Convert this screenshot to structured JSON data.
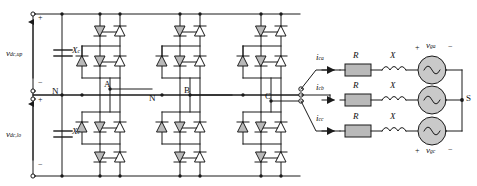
{
  "figure": {
    "type": "circuit-schematic",
    "background_color": "#ffffff",
    "line_color": "#1a1a1a",
    "device_fill": "#b9b9b9"
  },
  "dc_side": {
    "upper_source_label": "v",
    "upper_source_sub": "dc,up",
    "lower_source_label": "v",
    "lower_source_sub": "dc,lo",
    "upper_cap_label": "X",
    "upper_cap_sub": "c",
    "lower_cap_label": "X",
    "lower_cap_sub": "c",
    "plus_upper": "+",
    "minus_upper": "−",
    "plus_lower": "+",
    "minus_lower": "−",
    "neutral_label": "N"
  },
  "converter": {
    "legs": [
      {
        "phase_label": "A"
      },
      {
        "phase_label": "B"
      },
      {
        "phase_label": "C"
      }
    ],
    "neutral_rail_label": "N",
    "switch_plus_marker": "+",
    "devices_per_leg": 4,
    "clamping_diodes_per_leg": 2
  },
  "ac_side": {
    "lines": [
      {
        "current_label": "i",
        "current_sub": "ca",
        "resistor_label": "R",
        "reactance_label": "X",
        "source_label": "v",
        "source_sub": "ga",
        "polarity_plus": "+",
        "polarity_minus": "−"
      },
      {
        "current_label": "i",
        "current_sub": "cb",
        "resistor_label": "R",
        "reactance_label": "X",
        "source_label": "v",
        "source_sub": "gb",
        "polarity_plus": "+",
        "polarity_minus": "−"
      },
      {
        "current_label": "i",
        "current_sub": "cc",
        "resistor_label": "R",
        "reactance_label": "X",
        "source_label": "v",
        "source_sub": "gc",
        "polarity_plus": "+",
        "polarity_minus": "−"
      }
    ],
    "star_point_label": "S"
  }
}
